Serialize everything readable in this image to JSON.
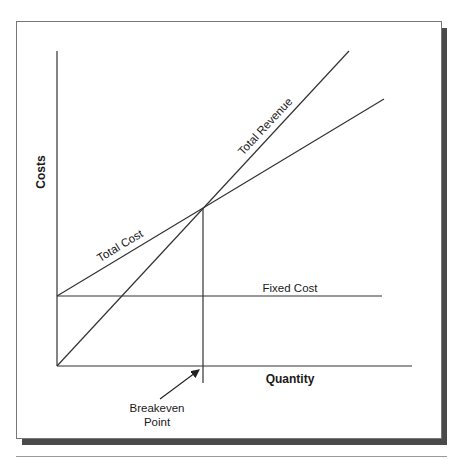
{
  "diagram": {
    "y_axis_label": "Costs",
    "x_axis_label": "Quantity",
    "lines": {
      "total_revenue": "Total Revenue",
      "total_cost": "Total Cost",
      "fixed_cost": "Fixed Cost"
    },
    "annotation": {
      "line1": "Breakeven",
      "line2": "Point"
    }
  },
  "colors": {
    "line": "#333333",
    "shadow": "#4a4a4a"
  }
}
